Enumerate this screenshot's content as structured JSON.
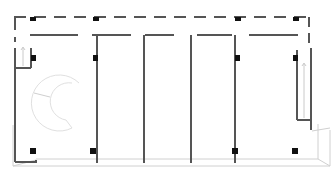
{
  "diagram": {
    "type": "floor-plan",
    "colors": {
      "wall": "#555555",
      "column": "#111111",
      "outline": "#cfcfcf",
      "stair_light": "#e6e6e6",
      "background": "#ffffff"
    },
    "outer_envelope": {
      "style": "dashed",
      "x1": 14,
      "y1": 17,
      "x2": 310,
      "y2": 17,
      "right_x": 310,
      "left_x": 14
    },
    "inner_corridor_wall_y": 35,
    "partition_walls_x": [
      31,
      97,
      144,
      191,
      237,
      298
    ],
    "columns": [
      {
        "x": 33,
        "y": 19
      },
      {
        "x": 95,
        "y": 19
      },
      {
        "x": 237,
        "y": 19
      },
      {
        "x": 295,
        "y": 19
      },
      {
        "x": 33,
        "y": 57
      },
      {
        "x": 95,
        "y": 57
      },
      {
        "x": 237,
        "y": 57
      },
      {
        "x": 295,
        "y": 57
      },
      {
        "x": 33,
        "y": 150
      },
      {
        "x": 94,
        "y": 150
      },
      {
        "x": 236,
        "y": 150
      },
      {
        "x": 296,
        "y": 150
      }
    ],
    "stairs": [
      {
        "name": "left-straight-stair",
        "x": 17,
        "y": 45,
        "w": 14,
        "h": 24
      },
      {
        "name": "curved-stair",
        "cx": 60,
        "cy": 97,
        "r": 28
      },
      {
        "name": "right-straight-stair",
        "x": 298,
        "y": 52,
        "w": 14,
        "h": 38
      }
    ]
  }
}
